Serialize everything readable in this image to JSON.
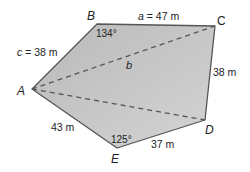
{
  "diagram": {
    "type": "pentagon-field",
    "fill_color": "#c4c4c4",
    "stroke_color": "#555555",
    "vertices": {
      "A": {
        "label": "A",
        "x": 32,
        "y": 89
      },
      "B": {
        "label": "B",
        "x": 97,
        "y": 24
      },
      "C": {
        "label": "C",
        "x": 215,
        "y": 26
      },
      "D": {
        "label": "D",
        "x": 205,
        "y": 120
      },
      "E": {
        "label": "E",
        "x": 117,
        "y": 148
      }
    },
    "sides": {
      "AB": {
        "var": "c",
        "text": " = 38 m"
      },
      "BC": {
        "var": "a",
        "text": " = 47 m"
      },
      "CD": {
        "text": "38 m"
      },
      "DE": {
        "text": "37 m"
      },
      "EA": {
        "text": "43 m"
      }
    },
    "diagonals": {
      "AC": {
        "label": "b"
      },
      "AD": {
        "label": ""
      }
    },
    "angles": {
      "B": "134°",
      "E": "125°"
    }
  }
}
